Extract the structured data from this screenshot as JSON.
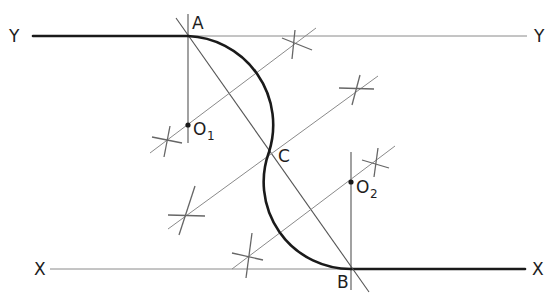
{
  "diagram": {
    "labels": {
      "y_left": "Y",
      "y_right": "Y",
      "x_left": "X",
      "x_right": "X",
      "point_a": "A",
      "point_b": "B",
      "point_c": "C",
      "center_1": "O",
      "center_1_sub": "1",
      "center_2": "O",
      "center_2_sub": "2"
    },
    "points": {
      "A": [
        188,
        36
      ],
      "B": [
        351,
        269
      ],
      "C": [
        269,
        152
      ],
      "O1": [
        188,
        125
      ],
      "O2": [
        351,
        182
      ]
    },
    "lines": {
      "YY": {
        "from": [
          32,
          36
        ],
        "to": [
          527,
          36
        ],
        "thick_until_x": 188
      },
      "XX": {
        "from": [
          50,
          269
        ],
        "to": [
          525,
          269
        ],
        "thick_from_x": 351
      }
    },
    "colors": {
      "ink": "#1a1a1a",
      "construction": "#8a8a8a",
      "background": "#ffffff"
    }
  }
}
